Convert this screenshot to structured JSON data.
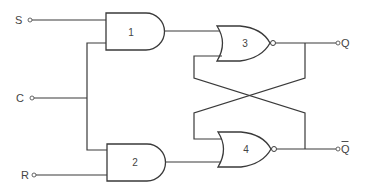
{
  "diagram": {
    "title": "",
    "type": "clocked SR latch logic circuit",
    "inputs": [
      {
        "label": "S"
      },
      {
        "label": "C"
      },
      {
        "label": "R"
      }
    ],
    "outputs": [
      {
        "label": "Q"
      },
      {
        "label": "Q",
        "overline": true
      }
    ],
    "gates": [
      {
        "id": "1",
        "type": "AND",
        "label": "1"
      },
      {
        "id": "2",
        "type": "AND",
        "label": "2"
      },
      {
        "id": "3",
        "type": "NOR",
        "label": "3"
      },
      {
        "id": "4",
        "type": "NOR",
        "label": "4"
      }
    ],
    "connections": [
      "S -> gate 1",
      "C -> gate 1",
      "C -> gate 2",
      "R -> gate 2",
      "gate 1 -> gate 3",
      "gate 2 -> gate 4",
      "gate 3 -> Q",
      "gate 4 -> Q-bar",
      "Q -> gate 4 (cross-coupled)",
      "Q-bar -> gate 3 (cross-coupled)"
    ],
    "colors": {
      "line": "#3a3a3a",
      "background": "#ffffff"
    }
  }
}
